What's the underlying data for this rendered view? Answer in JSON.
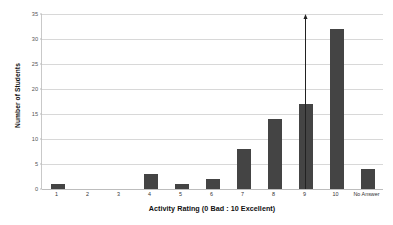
{
  "chart_data": {
    "type": "bar",
    "title": "",
    "subtitle": "",
    "xlabel": "Activity Rating (0 Bad : 10 Excellent)",
    "ylabel": "Number of Students",
    "categories": [
      "1",
      "2",
      "3",
      "4",
      "5",
      "6",
      "7",
      "8",
      "9",
      "10",
      "No Answer"
    ],
    "values": [
      1,
      0,
      0,
      3,
      1,
      2,
      8,
      14,
      17,
      32,
      4
    ],
    "ylim": [
      0,
      35
    ],
    "yticks": [
      0,
      5,
      10,
      15,
      20,
      25,
      30,
      35
    ],
    "ytick_labels": [
      "0",
      "5",
      "10",
      "15",
      "20",
      "25",
      "30",
      "35"
    ],
    "grid": true,
    "legend": false,
    "legend_position": "none",
    "bar_color": "#444444",
    "gridline_color": "#d8d8d8",
    "background_color": "#ffffff",
    "annotations": [
      {
        "type": "vertical-arrow",
        "name": "threshold-arrow",
        "between_categories": [
          "8",
          "9"
        ],
        "x_position_index": 8.5,
        "direction": "up",
        "from_value": 0,
        "to_value": 35,
        "color": "#222222",
        "label": ""
      }
    ]
  }
}
